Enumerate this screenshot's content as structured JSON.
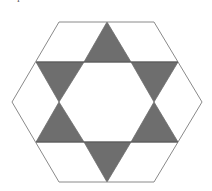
{
  "figure": {
    "title": "",
    "colors": {
      "background": "#ffffff",
      "stroke": "#8a8a8a",
      "shaded": "#6e6e6e"
    },
    "hexagon": [
      [
        59,
        22
      ],
      [
        154,
        22
      ],
      [
        202,
        102
      ],
      [
        154,
        182
      ],
      [
        59,
        182
      ],
      [
        12,
        102
      ]
    ],
    "horizontal_lines": [
      {
        "x1": 36,
        "y1": 62,
        "x2": 178,
        "y2": 62
      },
      {
        "x1": 36,
        "y1": 142,
        "x2": 178,
        "y2": 142
      }
    ],
    "shaded_triangles": [
      {
        "name": "top",
        "points": [
          [
            107,
            22
          ],
          [
            84,
            62
          ],
          [
            131,
            62
          ]
        ]
      },
      {
        "name": "upper-left",
        "points": [
          [
            36,
            62
          ],
          [
            84,
            62
          ],
          [
            59,
            102
          ]
        ]
      },
      {
        "name": "upper-right",
        "points": [
          [
            131,
            62
          ],
          [
            178,
            62
          ],
          [
            154,
            102
          ]
        ]
      },
      {
        "name": "lower-left",
        "points": [
          [
            59,
            102
          ],
          [
            36,
            142
          ],
          [
            84,
            142
          ]
        ]
      },
      {
        "name": "lower-right",
        "points": [
          [
            154,
            102
          ],
          [
            131,
            142
          ],
          [
            178,
            142
          ]
        ]
      },
      {
        "name": "bottom",
        "points": [
          [
            84,
            142
          ],
          [
            131,
            142
          ],
          [
            107,
            182
          ]
        ]
      }
    ],
    "shaded_count": "6",
    "corner_mark": "ı"
  }
}
